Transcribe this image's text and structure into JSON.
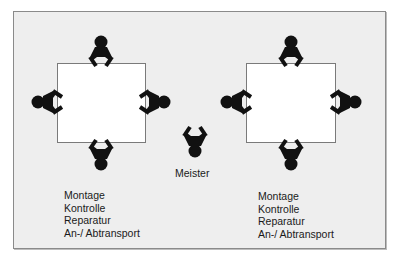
{
  "diagram": {
    "type": "workstation-layout",
    "colors": {
      "background": "#eeeeee",
      "table": "#ffffff",
      "person": "#111111",
      "text": "#1a1a1a"
    },
    "left_group": {
      "table": "square-table",
      "persons": [
        "top",
        "left",
        "right",
        "bottom"
      ],
      "tasks": [
        "Montage",
        "Kontrolle",
        "Reparatur",
        "An-/ Abtransport"
      ]
    },
    "center": {
      "label": "Meister"
    },
    "right_group": {
      "table": "square-table",
      "persons": [
        "top",
        "left",
        "right",
        "bottom"
      ],
      "tasks": [
        "Montage",
        "Kontrolle",
        "Reparatur",
        "An-/ Abtransport"
      ]
    }
  }
}
